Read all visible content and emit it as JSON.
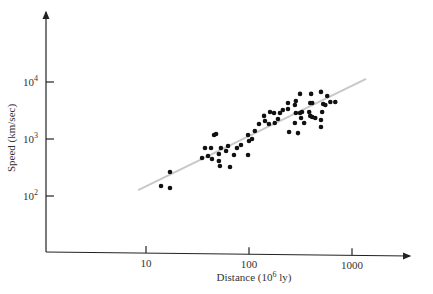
{
  "chart_data": {
    "type": "scatter",
    "title": "",
    "xlabel": "Distance (10^6 ly)",
    "ylabel": "Speed (km/sec)",
    "xscale": "log",
    "yscale": "log",
    "x_ticks": [
      {
        "value": 10,
        "label": "10"
      },
      {
        "value": 100,
        "label": "100"
      },
      {
        "value": 1000,
        "label": "1000"
      }
    ],
    "y_ticks": [
      {
        "value": 100,
        "base": "10",
        "exp": "2"
      },
      {
        "value": 1000,
        "base": "10",
        "exp": "3"
      },
      {
        "value": 10000,
        "base": "10",
        "exp": "4"
      }
    ],
    "grid": false,
    "legend": null,
    "series": [
      {
        "name": "Galaxies",
        "type": "scatter",
        "color": "#111111",
        "points": [
          [
            14,
            150
          ],
          [
            17.1,
            264
          ],
          [
            17.1,
            138
          ],
          [
            35,
            465
          ],
          [
            37.4,
            696
          ],
          [
            40,
            502
          ],
          [
            42.8,
            696
          ],
          [
            45.8,
            1176
          ],
          [
            47.9,
            1225
          ],
          [
            43.7,
            446
          ],
          [
            51,
            412
          ],
          [
            52.2,
            336
          ],
          [
            53.4,
            696
          ],
          [
            51,
            544
          ],
          [
            59.9,
            615
          ],
          [
            62.6,
            752
          ],
          [
            65.4,
            323
          ],
          [
            71.5,
            524
          ],
          [
            76.4,
            696
          ],
          [
            83.6,
            783
          ],
          [
            97.9,
            524
          ],
          [
            97.9,
            1176
          ],
          [
            100,
            922
          ],
          [
            107,
            1000
          ],
          [
            114,
            1380
          ],
          [
            125,
            1830
          ],
          [
            143,
            2070
          ],
          [
            140,
            2540
          ],
          [
            160,
            2980
          ],
          [
            175,
            2860
          ],
          [
            156,
            1830
          ],
          [
            178,
            1910
          ],
          [
            191,
            2240
          ],
          [
            200,
            2860
          ],
          [
            213,
            3230
          ],
          [
            239,
            4270
          ],
          [
            239,
            3350
          ],
          [
            245,
            1330
          ],
          [
            279,
            3950
          ],
          [
            285,
            4650
          ],
          [
            285,
            2860
          ],
          [
            279,
            1910
          ],
          [
            299,
            1270
          ],
          [
            313,
            6180
          ],
          [
            313,
            2860
          ],
          [
            327,
            2980
          ],
          [
            320,
            2340
          ],
          [
            343,
            1910
          ],
          [
            393,
            4270
          ],
          [
            411,
            4270
          ],
          [
            384,
            2980
          ],
          [
            411,
            2430
          ],
          [
            440,
            2340
          ],
          [
            401,
            6180
          ],
          [
            393,
            2540
          ],
          [
            500,
            6710
          ],
          [
            525,
            4100
          ],
          [
            513,
            2980
          ],
          [
            551,
            3950
          ],
          [
            500,
            2160
          ],
          [
            500,
            1620
          ],
          [
            575,
            5670
          ],
          [
            616,
            4450
          ],
          [
            688,
            4450
          ]
        ]
      },
      {
        "name": "Fit line",
        "type": "line",
        "color": "#c8c8c8",
        "points": [
          [
            8.4,
            127
          ],
          [
            1370,
            11300
          ]
        ]
      }
    ]
  }
}
